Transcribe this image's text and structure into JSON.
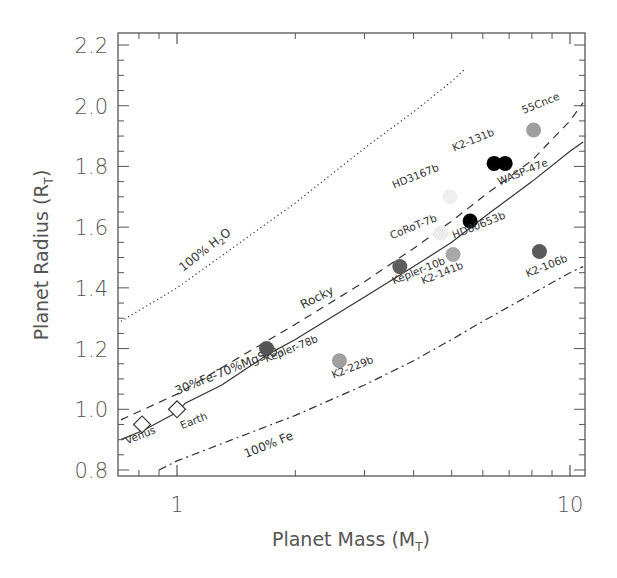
{
  "chart_data": {
    "type": "scatter",
    "title": "",
    "xlabel": "Planet Mass (M",
    "xlabel_sub": "T",
    "xlabel_end": ")",
    "ylabel": "Planet Radius (R",
    "ylabel_sub": "T",
    "ylabel_end": ")",
    "xscale": "log",
    "xlim": [
      0.72,
      11.0
    ],
    "ylim": [
      0.78,
      2.26
    ],
    "x_ticks": [
      {
        "value": 1,
        "label": "1"
      },
      {
        "value": 10,
        "label": "10"
      }
    ],
    "y_ticks": [
      {
        "value": 0.8,
        "label": "0.8"
      },
      {
        "value": 1.0,
        "label": "1.0"
      },
      {
        "value": 1.2,
        "label": "1.2"
      },
      {
        "value": 1.4,
        "label": "1.4"
      },
      {
        "value": 1.6,
        "label": "1.6"
      },
      {
        "value": 1.8,
        "label": "1.8"
      },
      {
        "value": 2.0,
        "label": "2.0"
      },
      {
        "value": 2.2,
        "label": "2.2"
      }
    ],
    "curves": [
      {
        "name": "100% H2O",
        "label": "100% H",
        "label_sub": "2",
        "label_end": "O",
        "style": "dotted",
        "points": [
          [
            0.72,
            1.29
          ],
          [
            1.0,
            1.4
          ],
          [
            2.0,
            1.68
          ],
          [
            3.0,
            1.86
          ],
          [
            4.0,
            1.98
          ],
          [
            5.0,
            2.08
          ],
          [
            5.4,
            2.12
          ]
        ]
      },
      {
        "name": "Rocky",
        "label": "Rocky",
        "style": "dashed",
        "points": [
          [
            0.72,
            0.965
          ],
          [
            1.0,
            1.05
          ],
          [
            2.0,
            1.28
          ],
          [
            3.0,
            1.42
          ],
          [
            4.0,
            1.53
          ],
          [
            5.0,
            1.62
          ],
          [
            6.0,
            1.7
          ],
          [
            8.0,
            1.82
          ],
          [
            10.0,
            1.95
          ],
          [
            10.8,
            2.01
          ]
        ]
      },
      {
        "name": "30%Fe-70%MgSiO3",
        "label": "30%Fe-70%MgSiO",
        "label_sub": "3",
        "style": "solid",
        "points": [
          [
            0.72,
            0.9
          ],
          [
            0.82,
            0.93
          ],
          [
            1.0,
            0.99
          ],
          [
            1.05,
            1.02
          ],
          [
            1.3,
            1.08
          ],
          [
            1.7,
            1.18
          ],
          [
            2.0,
            1.23
          ],
          [
            3.0,
            1.37
          ],
          [
            4.0,
            1.47
          ],
          [
            5.0,
            1.55
          ],
          [
            6.0,
            1.63
          ],
          [
            8.0,
            1.75
          ],
          [
            10.0,
            1.85
          ],
          [
            10.8,
            1.88
          ]
        ]
      },
      {
        "name": "100% Fe",
        "label": "100% Fe",
        "style": "dashdot",
        "points": [
          [
            0.9,
            0.8
          ],
          [
            1.0,
            0.83
          ],
          [
            2.0,
            0.98
          ],
          [
            3.0,
            1.08
          ],
          [
            4.0,
            1.16
          ],
          [
            5.0,
            1.23
          ],
          [
            6.0,
            1.29
          ],
          [
            8.0,
            1.38
          ],
          [
            10.0,
            1.45
          ],
          [
            10.8,
            1.47
          ]
        ]
      }
    ],
    "solar_planets": [
      {
        "name": "Venus",
        "mass": 0.815,
        "radius": 0.95
      },
      {
        "name": "Earth",
        "mass": 1.0,
        "radius": 1.0
      }
    ],
    "exoplanets": [
      {
        "name": "Kepler-78b",
        "mass": 1.69,
        "radius": 1.2,
        "color": "#555555",
        "label_pos": "below-right"
      },
      {
        "name": "K2-229b",
        "mass": 2.59,
        "radius": 1.16,
        "color": "#a0a0a0",
        "label_pos": "below"
      },
      {
        "name": "Kepler-10b",
        "mass": 3.69,
        "radius": 1.47,
        "color": "#5e5e5e",
        "label_pos": "below"
      },
      {
        "name": "CoRoT-7b",
        "mass": 4.69,
        "radius": 1.58,
        "color": "#ececec",
        "label_pos": "above-left"
      },
      {
        "name": "K2-141b",
        "mass": 5.04,
        "radius": 1.51,
        "color": "#a8a8a8",
        "label_pos": "below"
      },
      {
        "name": "HD80653b",
        "mass": 5.57,
        "radius": 1.62,
        "color": "#000000",
        "label_pos": "below"
      },
      {
        "name": "HD3167b",
        "mass": 4.95,
        "radius": 1.7,
        "color": "#efefef",
        "label_pos": "above-left"
      },
      {
        "name": "K2-131b",
        "mass": 6.41,
        "radius": 1.81,
        "color": "#000000",
        "label_pos": "above-left"
      },
      {
        "name": "WASP-47e",
        "mass": 6.84,
        "radius": 1.81,
        "color": "#000000",
        "label_pos": "below"
      },
      {
        "name": "55Cnce",
        "mass": 8.08,
        "radius": 1.92,
        "color": "#9e9e9e",
        "label_pos": "above"
      },
      {
        "name": "K2-106b",
        "mass": 8.36,
        "radius": 1.52,
        "color": "#5a5a5a",
        "label_pos": "below"
      }
    ],
    "grid": false,
    "legend": "none"
  }
}
